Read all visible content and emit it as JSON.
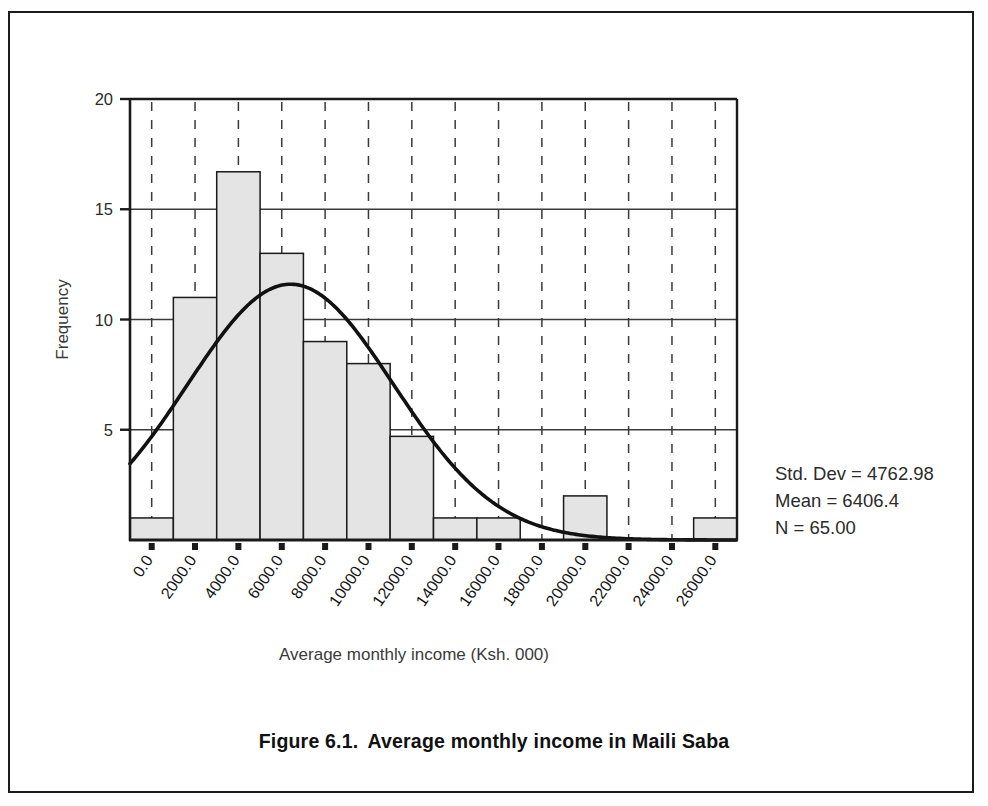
{
  "figure": {
    "caption_number": "Figure 6.1.",
    "caption_text": "Average monthly income in Maili Saba"
  },
  "statistics": {
    "std_dev_label": "Std. Dev = 4762.98",
    "mean_label": "Mean = 6406.4",
    "n_label": "N = 65.00"
  },
  "colors": {
    "bar_fill": "#e4e4e4",
    "bar_stroke": "#1a1a1a",
    "curve": "#111111",
    "axis": "#1a1a1a",
    "gridline": "#3a3a3a",
    "text": "#2b2b2b"
  },
  "chart_data": {
    "type": "bar",
    "title": "Average monthly income in Maili Saba",
    "subtitle": "",
    "xlabel": "Average monthly income (Ksh. 000)",
    "ylabel": "Frequency",
    "xlim": [
      -1000,
      27000
    ],
    "ylim": [
      0,
      20
    ],
    "xticks": [
      0,
      2000,
      4000,
      6000,
      8000,
      10000,
      12000,
      14000,
      16000,
      18000,
      20000,
      22000,
      24000,
      26000
    ],
    "xtick_labels": [
      "0.0",
      "2000.0",
      "4000.0",
      "6000.0",
      "8000.0",
      "10000.0",
      "12000.0",
      "14000.0",
      "16000.0",
      "18000.0",
      "20000.0",
      "22000.0",
      "24000.0",
      "26000.0"
    ],
    "yticks": [
      5,
      10,
      15,
      20
    ],
    "ytick_labels": [
      "5",
      "10",
      "15",
      "20"
    ],
    "grid": "horizontal-solid-and-vertical-dashed",
    "legend": "none",
    "bin_width": 2000,
    "bin_starts": [
      -1000,
      1000,
      3000,
      5000,
      7000,
      9000,
      11000,
      13000,
      15000,
      17000,
      19000,
      21000,
      23000,
      25000
    ],
    "categories": [
      "0.0",
      "2000.0",
      "4000.0",
      "6000.0",
      "8000.0",
      "10000.0",
      "12000.0",
      "14000.0",
      "16000.0",
      "18000.0",
      "20000.0",
      "22000.0",
      "24000.0",
      "26000.0"
    ],
    "values": [
      1,
      11,
      16.7,
      13,
      9,
      8,
      4.7,
      1,
      1,
      0,
      2,
      0,
      0,
      1
    ],
    "annotations": [
      "Std. Dev = 4762.98",
      "Mean = 6406.4",
      "N = 65.00"
    ],
    "overlay_curve": {
      "type": "normal",
      "mean": 6406.4,
      "std_dev": 4762.98,
      "n": 65,
      "peak_frequency": 11.6
    }
  }
}
